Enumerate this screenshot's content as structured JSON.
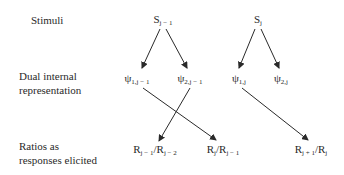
{
  "rows": {
    "stimuli": "Stimuli",
    "dual_line1": "Dual internal",
    "dual_line2": "representation",
    "ratios_line1": "Ratios as",
    "ratios_line2": "responses elicited"
  },
  "nodes": {
    "s_prev": {
      "base": "S",
      "sub": "j − 1"
    },
    "s_cur": {
      "base": "S",
      "sub": "j"
    },
    "psi1_prev": {
      "base": "ψ",
      "sub": "1,j − 1"
    },
    "psi2_prev": {
      "base": "ψ",
      "sub": "2,j − 1"
    },
    "psi1_cur": {
      "base": "ψ",
      "sub": "1,j"
    },
    "psi2_cur": {
      "base": "ψ",
      "sub": "2,j"
    },
    "r1": {
      "a": "R",
      "a_sub": "j − 1",
      "b": "/R",
      "b_sub": "j − 2"
    },
    "r2": {
      "a": "R",
      "a_sub": "j",
      "b": "/R",
      "b_sub": "j − 1"
    },
    "r3": {
      "a": "R",
      "a_sub": "j + 1",
      "b": "/R",
      "b_sub": "j"
    }
  },
  "colors": {
    "ink": "#2a2a2a"
  }
}
